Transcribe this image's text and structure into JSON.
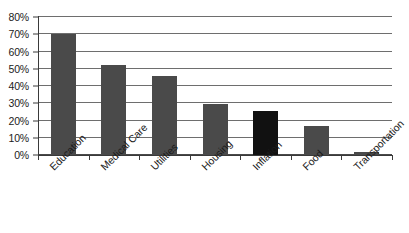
{
  "chart_data": {
    "type": "bar",
    "title": "",
    "subtitle": "",
    "xlabel": "",
    "ylabel": "",
    "categories": [
      "Education",
      "Medical Care",
      "Utilities",
      "Housing",
      "Inflation",
      "Food",
      "Transportation"
    ],
    "values": [
      70,
      52,
      46,
      29.5,
      25.5,
      17,
      1.5
    ],
    "ylim": [
      0,
      80
    ],
    "ytick_step": 10,
    "ytick_labels": [
      "0%",
      "10%",
      "20%",
      "30%",
      "40%",
      "50%",
      "60%",
      "70%",
      "80%"
    ],
    "ytick_values": [
      0,
      10,
      20,
      30,
      40,
      50,
      60,
      70,
      80
    ],
    "grid": true,
    "grid_axis": "y",
    "legend": false,
    "legend_position": "none",
    "value_format": "percent",
    "bar_colors": [
      "#4a4a4a",
      "#4a4a4a",
      "#4a4a4a",
      "#4a4a4a",
      "#111111",
      "#4a4a4a",
      "#4a4a4a"
    ],
    "highlight_category": "Inflation",
    "annotations": []
  },
  "colors": {
    "bar_default": "#4a4a4a",
    "bar_highlight": "#111111",
    "gridline": "#6e6e6e",
    "axis": "#3a3a3a",
    "text": "#1b1b1b",
    "background": "#ffffff"
  }
}
